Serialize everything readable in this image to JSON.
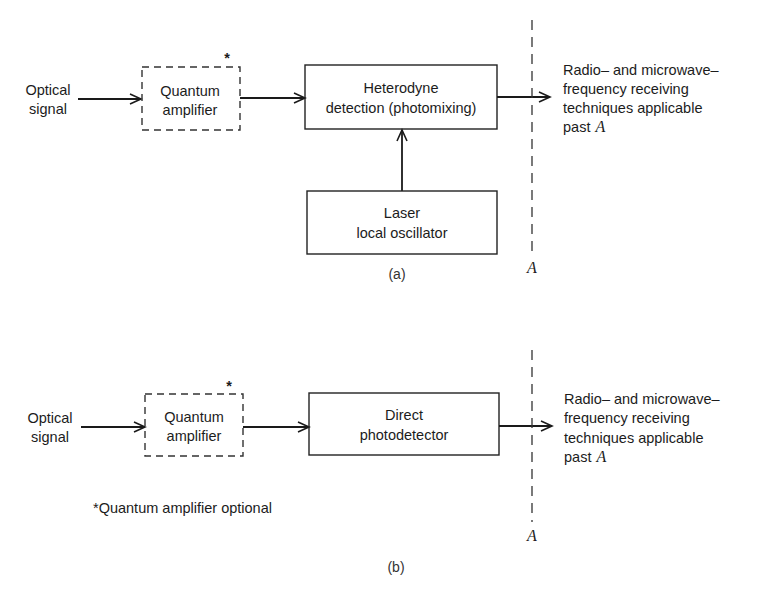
{
  "diagram_a": {
    "input_label": [
      "Optical",
      "signal"
    ],
    "amplifier_label": [
      "Quantum",
      "amplifier"
    ],
    "amplifier_mark": "*",
    "detector_label": [
      "Heterodyne",
      "detection (photomixing)"
    ],
    "oscillator_label": [
      "Laser",
      "local oscillator"
    ],
    "output_label": [
      "Radio– and microwave–",
      "frequency receiving",
      "techniques applicable",
      "past"
    ],
    "output_label_var": "A",
    "boundary_label": "A",
    "caption": "(a)"
  },
  "diagram_b": {
    "input_label": [
      "Optical",
      "signal"
    ],
    "amplifier_label": [
      "Quantum",
      "amplifier"
    ],
    "amplifier_mark": "*",
    "detector_label": [
      "Direct",
      "photodetector"
    ],
    "output_label": [
      "Radio– and microwave–",
      "frequency receiving",
      "techniques applicable",
      "past"
    ],
    "output_label_var": "A",
    "boundary_label": "A",
    "footnote": "*Quantum amplifier optional",
    "caption": "(b)"
  }
}
